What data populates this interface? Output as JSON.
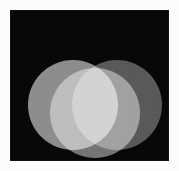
{
  "figure": {
    "description": "Three overlapping light-grey discs on a black square, overlaps brightening to white at the centre",
    "width": 179,
    "height": 171
  },
  "canvas": {
    "background_color": "#fcfcfc",
    "plate_color": "#070707",
    "plate_x": 10,
    "plate_y": 10,
    "plate_width": 159,
    "plate_height": 151
  },
  "diagram": {
    "type": "venn-three-circle",
    "blend_mode": "screen",
    "circle_radius": 45,
    "circles": [
      {
        "id": "left",
        "label": "Left disc",
        "cx": 63,
        "cy": 95,
        "r": 45,
        "color": "#878787"
      },
      {
        "id": "right",
        "label": "Right disc",
        "cx": 107,
        "cy": 95,
        "r": 45,
        "color": "#525252"
      },
      {
        "id": "top",
        "label": "Top disc",
        "cx": 85,
        "cy": 103,
        "r": 45,
        "color": "#6e6e6e"
      }
    ],
    "regions": [
      {
        "id": "left-only",
        "label": "Left disc only",
        "color": "#878787"
      },
      {
        "id": "right-only",
        "label": "Right disc only",
        "color": "#525252"
      },
      {
        "id": "top-only",
        "label": "Top disc only",
        "color": "#6e6e6e"
      },
      {
        "id": "top-left",
        "label": "Top and left overlap",
        "color": "#c8c8c8"
      },
      {
        "id": "top-right",
        "label": "Top and right overlap",
        "color": "#8a8a8a"
      },
      {
        "id": "left-right",
        "label": "Left and right overlap",
        "color": "#9a9a9a"
      },
      {
        "id": "triple-center",
        "label": "All three overlap",
        "color": "#ffffff"
      },
      {
        "id": "background",
        "label": "Background outside discs",
        "color": "#070707"
      }
    ]
  }
}
